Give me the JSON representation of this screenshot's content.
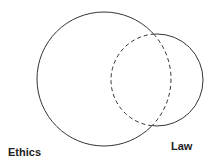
{
  "diagram": {
    "type": "venn",
    "sets": [
      {
        "id": "ethics",
        "label": "Ethics",
        "cx": 104,
        "cy": 79,
        "r": 67
      },
      {
        "id": "law",
        "label": "Law",
        "cx": 157,
        "cy": 80,
        "r": 46
      }
    ],
    "style": {
      "stroke_color": "#333333",
      "dashed_segments": "portions of each circle lying inside the other"
    }
  },
  "labels": {
    "ethics": "Ethics",
    "law": "Law"
  }
}
